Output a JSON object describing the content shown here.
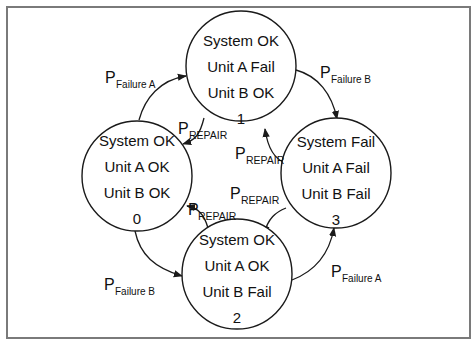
{
  "diagram": {
    "type": "markov-state-transition",
    "states": [
      {
        "id": "0",
        "lines": [
          "System OK",
          "Unit A OK",
          "Unit B OK"
        ],
        "number": "0"
      },
      {
        "id": "1",
        "lines": [
          "System OK",
          "Unit A Fail",
          "Unit B OK"
        ],
        "number": "1"
      },
      {
        "id": "2",
        "lines": [
          "System OK",
          "Unit A OK",
          "Unit B Fail"
        ],
        "number": "2"
      },
      {
        "id": "3",
        "lines": [
          "System Fail",
          "Unit A Fail",
          "Unit B Fail"
        ],
        "number": "3"
      }
    ],
    "transitions": [
      {
        "from": "0",
        "to": "1",
        "symbol": "P",
        "subscript": "Failure A"
      },
      {
        "from": "1",
        "to": "3",
        "symbol": "P",
        "subscript": "Failure B"
      },
      {
        "from": "0",
        "to": "2",
        "symbol": "P",
        "subscript": "Failure B"
      },
      {
        "from": "2",
        "to": "3",
        "symbol": "P",
        "subscript": "Failure A"
      },
      {
        "from": "1",
        "to": "0",
        "symbol": "P",
        "subscript": "REPAIR"
      },
      {
        "from": "3",
        "to": "1",
        "symbol": "P",
        "subscript": "REPAIR"
      },
      {
        "from": "3",
        "to": "2",
        "symbol": "P",
        "subscript": "REPAIR"
      },
      {
        "from": "2",
        "to": "0",
        "symbol": "P",
        "subscript": "REPAIR"
      }
    ]
  },
  "colors": {
    "frame_border": "#7a7a7a",
    "stroke": "#1a1a1a",
    "background": "#ffffff"
  }
}
